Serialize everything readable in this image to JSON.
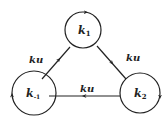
{
  "diagram": {
    "type": "cyclic state graph",
    "nodes": [
      {
        "id": "k1",
        "label": "k",
        "subscript": "1",
        "position": "top"
      },
      {
        "id": "k-1",
        "label": "k",
        "subscript": "-1",
        "position": "bottom-left"
      },
      {
        "id": "k2",
        "label": "k",
        "subscript": "2",
        "position": "bottom-right"
      }
    ],
    "edges": [
      {
        "from": "k-1",
        "to": "k1",
        "label": "ku"
      },
      {
        "from": "k1",
        "to": "k2",
        "label": "ku"
      },
      {
        "from": "k2",
        "to": "k-1",
        "label": "ku"
      }
    ],
    "self_loops": [
      "k1",
      "k-1",
      "k2"
    ],
    "stroke_color": "#222222",
    "background": "#ffffff"
  }
}
